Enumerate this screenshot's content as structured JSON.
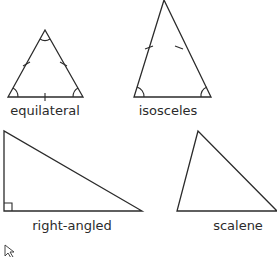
{
  "diagram": {
    "title": "",
    "stroke_color": "#2b2b2b",
    "background": "#ffffff",
    "triangles": [
      {
        "id": "equilateral",
        "label": "equilateral",
        "points": [
          [
            45,
            30
          ],
          [
            8,
            97
          ],
          [
            83,
            97
          ]
        ],
        "equal_side_ticks": 3,
        "angle_arcs": 3,
        "label_pos": [
          45,
          104
        ]
      },
      {
        "id": "isosceles",
        "label": "isosceles",
        "points": [
          [
            164,
            0
          ],
          [
            134,
            97
          ],
          [
            211,
            97
          ]
        ],
        "equal_side_ticks": 2,
        "angle_arcs": 2,
        "label_pos": [
          168,
          104
        ]
      },
      {
        "id": "right-angled",
        "label": "right-angled",
        "points": [
          [
            4,
            131
          ],
          [
            4,
            211
          ],
          [
            142,
            211
          ]
        ],
        "right_angle_marker": true,
        "label_pos": [
          72,
          219
        ]
      },
      {
        "id": "scalene",
        "label": "scalene",
        "points": [
          [
            198,
            131
          ],
          [
            177,
            211
          ],
          [
            277,
            211
          ]
        ],
        "label_pos": [
          238,
          219
        ]
      }
    ]
  },
  "cursor": {
    "icon": "mouse-pointer-icon",
    "x": 5,
    "y": 245
  }
}
